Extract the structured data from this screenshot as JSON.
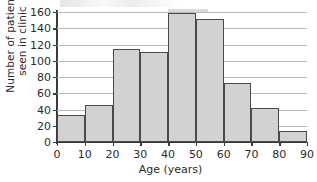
{
  "chart_data": {
    "type": "bar",
    "title": "",
    "xlabel": "Age (years)",
    "ylabel_lines": [
      "Number of patients",
      "seen in clinic"
    ],
    "ylabel": "Number of patients seen in clinic",
    "categories": [
      "0-10",
      "10-20",
      "20-30",
      "30-40",
      "40-50",
      "50-60",
      "60-70",
      "70-80",
      "80-90"
    ],
    "bin_edges": [
      0,
      10,
      20,
      30,
      40,
      50,
      60,
      70,
      80,
      90
    ],
    "values": [
      33,
      45,
      115,
      111,
      159,
      152,
      73,
      42,
      13
    ],
    "xlim": [
      0,
      90
    ],
    "ylim": [
      0,
      160
    ],
    "xticks": [
      0,
      10,
      20,
      30,
      40,
      50,
      60,
      70,
      80,
      90
    ],
    "yticks": [
      0,
      20,
      40,
      60,
      80,
      100,
      120,
      140,
      160
    ],
    "xtick_labels": [
      "0",
      "10",
      "20",
      "30",
      "40",
      "50",
      "60",
      "70",
      "80",
      "90"
    ],
    "ytick_labels": [
      "0",
      "20",
      "40",
      "60",
      "80",
      "100",
      "120",
      "140",
      "160"
    ],
    "grid": true,
    "legend": false,
    "bar_fill_color": "#d2d2d2",
    "bar_edge_color": "#4a4a4a",
    "axis_color": "#3a3a3a",
    "grid_color": "#b9b9b9",
    "background_color": "#ffffff"
  }
}
